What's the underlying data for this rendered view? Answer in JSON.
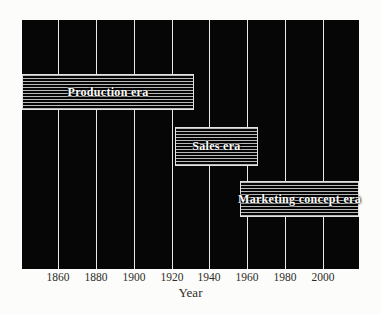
{
  "chart_data": {
    "type": "bar",
    "variant": "horizontal-timeline",
    "title": "",
    "xlabel": "Year",
    "ylabel": "",
    "x_ticks": [
      "1860",
      "1880",
      "1900",
      "1920",
      "1940",
      "1960",
      "1980",
      "2000"
    ],
    "x_tick_years": [
      1860,
      1880,
      1900,
      1920,
      1940,
      1960,
      1980,
      2000
    ],
    "x_range": [
      1841,
      2019
    ],
    "grid": "vertical-gridlines-on",
    "legend": "none",
    "bars": [
      {
        "label": "Production era",
        "start_year": 1841,
        "end_year": 1932
      },
      {
        "label": "Sales era",
        "start_year": 1922,
        "end_year": 1966
      },
      {
        "label": "Marketing concept era",
        "start_year": 1956,
        "end_year": 2019
      }
    ],
    "colors": {
      "page_background": "#fcfcfa",
      "plot_background": "#060606",
      "gridline": "#e8e8e8",
      "bar_fill": "#060606",
      "bar_stripe": "#b9b9b9",
      "bar_border": "#e2e2e2",
      "bar_text": "#ffffff",
      "axis_text": "#2e2c28"
    }
  }
}
